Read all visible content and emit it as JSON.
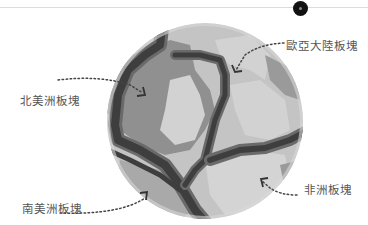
{
  "diagram": {
    "labels": {
      "eurasian": "歐亞大陸板塊",
      "north_american": "北美洲板塊",
      "south_american": "南美洲板塊",
      "african": "非洲板塊"
    },
    "colors": {
      "ocean": "#bfbfbf",
      "land_dark": "#8f8f8f",
      "land_light": "#cfcfcf",
      "plate_boundary": "#3e3e3e",
      "boundary_shadow": "#6a6a6a",
      "pin": "#111111",
      "label_text": "#555555"
    }
  }
}
